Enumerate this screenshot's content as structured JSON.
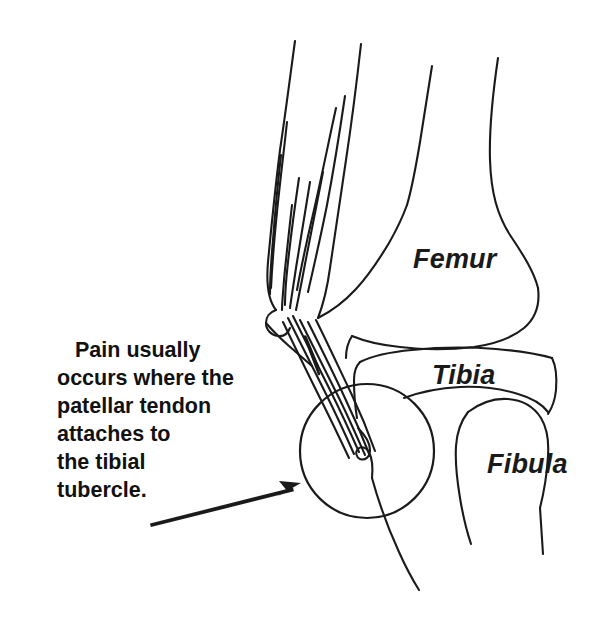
{
  "figure": {
    "type": "anatomical-line-drawing",
    "background_color": "#ffffff",
    "ink_color": "#1a1a1a",
    "width": 599,
    "height": 617
  },
  "labels": {
    "femur": "Femur",
    "tibia": "Tibia",
    "fibula": "Fibula"
  },
  "caption": {
    "lines": [
      "Pain usually",
      "occurs where the",
      "patellar tendon",
      "attaches to",
      "the tibial",
      "tubercle."
    ],
    "full_text": "Pain usually occurs where the patellar tendon attaches to the tibial tubercle."
  },
  "annotations": {
    "highlight_circle": {
      "name": "tibial-tubercle-highlight-circle",
      "center_x": 367,
      "center_y": 451,
      "radius": 67
    },
    "pointer_arrow": {
      "name": "caption-pointer-arrow",
      "tail_x": 150,
      "tail_y": 521,
      "tip_x": 301,
      "tip_y": 483
    }
  },
  "structures": [
    "quadriceps-tendon-fibers",
    "patella",
    "patellar-tendon",
    "tibial-tubercle",
    "femoral-condyle",
    "tibial-plateau",
    "fibular-head"
  ]
}
